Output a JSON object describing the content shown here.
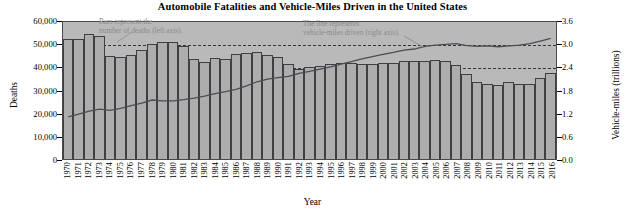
{
  "chart_data": {
    "type": "bar",
    "title": "Automobile Fatalities and Vehicle-Miles Driven in the United States",
    "xlabel": "Year",
    "ylabel": "Deaths",
    "y2label": "Vehicle-miles (trillions)",
    "ylim": [
      0,
      60000
    ],
    "y2lim": [
      0.0,
      3.6
    ],
    "yticks": [
      "0",
      "10,000",
      "20,000",
      "30,000",
      "40,000",
      "50,000",
      "60,000"
    ],
    "ytick_values": [
      0,
      10000,
      20000,
      30000,
      40000,
      50000,
      60000
    ],
    "y2ticks": [
      "0.0",
      "0.6",
      "1.2",
      "1.8",
      "2.4",
      "3.0",
      "3.6"
    ],
    "y2tick_values": [
      0.0,
      0.6,
      1.2,
      1.8,
      2.4,
      3.0,
      3.6
    ],
    "grid": true,
    "legend_position": "none",
    "categories": [
      "1970",
      "1971",
      "1972",
      "1973",
      "1974",
      "1975",
      "1976",
      "1977",
      "1978",
      "1979",
      "1980",
      "1981",
      "1982",
      "1983",
      "1984",
      "1985",
      "1986",
      "1987",
      "1988",
      "1989",
      "1990",
      "1991",
      "1992",
      "1993",
      "1994",
      "1995",
      "1996",
      "1997",
      "1998",
      "1999",
      "2000",
      "2001",
      "2002",
      "2003",
      "2004",
      "2005",
      "2006",
      "2007",
      "2008",
      "2009",
      "2010",
      "2011",
      "2012",
      "2013",
      "2014",
      "2015",
      "2016"
    ],
    "series": [
      {
        "name": "Deaths",
        "type": "bar",
        "axis": "left",
        "values": [
          52627,
          52542,
          54589,
          54052,
          45196,
          44525,
          45523,
          47878,
          50331,
          51093,
          51091,
          49301,
          43945,
          42589,
          44257,
          43825,
          46087,
          46390,
          47087,
          45582,
          44599,
          41508,
          39250,
          40150,
          40716,
          41817,
          42065,
          42013,
          41501,
          41717,
          41945,
          42196,
          43005,
          42884,
          42836,
          43510,
          42708,
          41259,
          37423,
          33883,
          32999,
          32479,
          33782,
          32893,
          32744,
          35484,
          37461
        ]
      },
      {
        "name": "Vehicle-miles driven",
        "type": "line",
        "axis": "right",
        "values": [
          1.11,
          1.18,
          1.26,
          1.31,
          1.28,
          1.33,
          1.4,
          1.47,
          1.55,
          1.53,
          1.53,
          1.56,
          1.6,
          1.65,
          1.72,
          1.77,
          1.83,
          1.92,
          2.03,
          2.1,
          2.14,
          2.17,
          2.25,
          2.3,
          2.36,
          2.42,
          2.49,
          2.56,
          2.63,
          2.69,
          2.75,
          2.8,
          2.86,
          2.89,
          2.96,
          2.99,
          3.01,
          3.03,
          2.98,
          2.96,
          2.97,
          2.95,
          2.97,
          2.99,
          3.03,
          3.1,
          3.17
        ]
      }
    ],
    "annotations": [
      {
        "name": "bars-annotation",
        "text": "Bars represent the\nnumber of deaths (left axis)."
      },
      {
        "name": "line-annotation",
        "text": "The line represents\nvehicle-miles driven (right axis)."
      }
    ],
    "colors": {
      "bar_fill": "#adadad",
      "bar_border": "#3d3f42",
      "plot_background": "#b9b9b9",
      "line": "#4a4d52",
      "gridline": "#33363a",
      "annotation_text": "#8a8a8a"
    }
  }
}
